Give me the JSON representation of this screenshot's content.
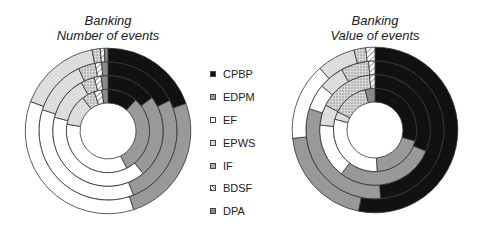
{
  "legend": [
    {
      "label": "CPBP",
      "fill": "#111111",
      "pattern": "solid"
    },
    {
      "label": "EDPM",
      "fill": "#999999",
      "pattern": "solid"
    },
    {
      "label": "EF",
      "fill": "#ffffff",
      "pattern": "solid"
    },
    {
      "label": "EPWS",
      "fill": "#dddddd",
      "pattern": "solid"
    },
    {
      "label": "IF",
      "fill": "#cccccc",
      "pattern": "dots"
    },
    {
      "label": "BDSF",
      "fill": "#ffffff",
      "pattern": "hatch"
    },
    {
      "label": "DPA",
      "fill": "#8a8a8a",
      "pattern": "solid"
    }
  ],
  "chart_data": [
    {
      "type": "pie",
      "subtype": "multi-ring donut",
      "title": "Banking",
      "subtitle": "Number of events",
      "categories": [
        "CPBP",
        "EDPM",
        "EF",
        "EPWS",
        "IF",
        "BDSF",
        "DPA"
      ],
      "rings_inner_to_outer": [
        {
          "values": [
            11.6,
            31.0,
            35.0,
            12.0,
            5.0,
            3.0,
            2.4
          ]
        },
        {
          "values": [
            14.7,
            24.3,
            40.0,
            13.0,
            4.0,
            2.0,
            2.0
          ]
        },
        {
          "values": [
            17.7,
            26.3,
            36.0,
            13.0,
            4.0,
            1.5,
            1.5
          ]
        },
        {
          "values": [
            19.6,
            25.4,
            35.8,
            16.1,
            1.6,
            0.8,
            0.7
          ]
        }
      ]
    },
    {
      "type": "pie",
      "subtype": "multi-ring donut",
      "title": "Banking",
      "subtitle": "Value of events",
      "categories": [
        "CPBP",
        "EDPM",
        "EF",
        "EPWS",
        "IF",
        "BDSF",
        "DPA"
      ],
      "rings_inner_to_outer": [
        {
          "values": [
            29.3,
            19.9,
            30.0,
            3.0,
            14.0,
            0.0,
            3.8
          ]
        },
        {
          "values": [
            31.3,
            29.1,
            16.0,
            6.0,
            16.0,
            1.6,
            0.0
          ]
        },
        {
          "values": [
            48.7,
            31.3,
            6.0,
            6.0,
            6.5,
            1.5,
            0.0
          ]
        },
        {
          "values": [
            53.2,
            20.2,
            15.0,
            7.5,
            2.3,
            1.8,
            0.0
          ]
        }
      ]
    }
  ]
}
